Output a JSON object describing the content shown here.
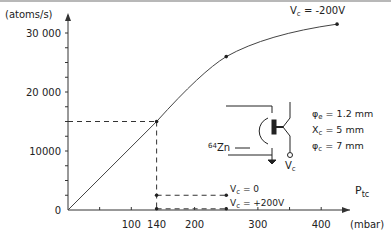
{
  "chart_data": {
    "type": "line",
    "title": "",
    "ylabel": "(atoms/s)",
    "xlabel": "P",
    "xlabel_sub": "tc",
    "xunit": "(mbar)",
    "xlim": [
      0,
      450
    ],
    "ylim": [
      0,
      33000
    ],
    "grid": false,
    "x_ticks": [
      {
        "value": 50,
        "label": ""
      },
      {
        "value": 100,
        "label": "100"
      },
      {
        "value": 140,
        "label": "140"
      },
      {
        "value": 200,
        "label": "200"
      },
      {
        "value": 250,
        "label": ""
      },
      {
        "value": 300,
        "label": "300"
      },
      {
        "value": 350,
        "label": ""
      },
      {
        "value": 400,
        "label": "400"
      }
    ],
    "y_ticks": [
      {
        "value": 0,
        "label": "0"
      },
      {
        "value": 2500,
        "label": ""
      },
      {
        "value": 5000,
        "label": ""
      },
      {
        "value": 7500,
        "label": ""
      },
      {
        "value": 10000,
        "label": "10000"
      },
      {
        "value": 12500,
        "label": ""
      },
      {
        "value": 15000,
        "label": ""
      },
      {
        "value": 17500,
        "label": ""
      },
      {
        "value": 20000,
        "label": "20 000"
      },
      {
        "value": 22500,
        "label": ""
      },
      {
        "value": 25000,
        "label": ""
      },
      {
        "value": 27500,
        "label": ""
      },
      {
        "value": 30000,
        "label": "30 000"
      }
    ],
    "series": [
      {
        "name": "Vc = -200V",
        "label_prefix": "V",
        "label_sub": "c",
        "label_suffix": " = -200V",
        "x": [
          0,
          140,
          250,
          425
        ],
        "y": [
          0,
          15000,
          26000,
          31500
        ],
        "markers": [
          140,
          250,
          425
        ]
      },
      {
        "name": "Vc = 0",
        "label_prefix": "V",
        "label_sub": "c",
        "label_suffix": " = 0",
        "x": [
          140,
          250
        ],
        "y": [
          2500,
          2500
        ],
        "dashed": true
      },
      {
        "name": "Vc = +200V",
        "label_prefix": "V",
        "label_sub": "c",
        "label_suffix": " = +200V",
        "x": [
          140,
          250
        ],
        "y": [
          200,
          200
        ],
        "dashed": true
      }
    ],
    "guides": [
      {
        "from": [
          0,
          15000
        ],
        "to": [
          140,
          15000
        ]
      },
      {
        "from": [
          140,
          15000
        ],
        "to": [
          140,
          0
        ]
      }
    ],
    "inset": {
      "isotope_mass": "64",
      "isotope_symbol": "Zn",
      "terminal_label_main": "V",
      "terminal_label_sub": "c",
      "params": [
        {
          "sym": "φ",
          "sub": "e",
          "text": " = 1.2 mm"
        },
        {
          "sym": "X",
          "sub": "c",
          "text": " = 5   mm"
        },
        {
          "sym": "φ",
          "sub": "c",
          "text": " = 7   mm"
        }
      ]
    }
  }
}
